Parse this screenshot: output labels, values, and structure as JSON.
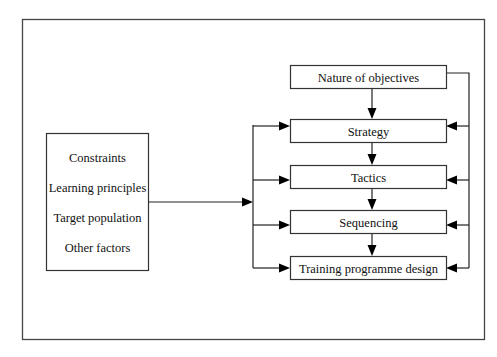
{
  "diagram": {
    "input_box": {
      "items": [
        "Constraints",
        "Learning principles",
        "Target population",
        "Other factors"
      ]
    },
    "nodes": [
      {
        "id": "objectives",
        "label": "Nature of objectives"
      },
      {
        "id": "strategy",
        "label": "Strategy"
      },
      {
        "id": "tactics",
        "label": "Tactics"
      },
      {
        "id": "sequencing",
        "label": "Sequencing"
      },
      {
        "id": "design",
        "label": "Training programme design"
      }
    ],
    "edges": [
      {
        "from": "objectives",
        "to": "strategy"
      },
      {
        "from": "strategy",
        "to": "tactics"
      },
      {
        "from": "tactics",
        "to": "sequencing"
      },
      {
        "from": "sequencing",
        "to": "design"
      },
      {
        "from": "input_box",
        "to": "strategy"
      },
      {
        "from": "input_box",
        "to": "tactics"
      },
      {
        "from": "input_box",
        "to": "sequencing"
      },
      {
        "from": "input_box",
        "to": "design"
      },
      {
        "from": "objectives",
        "to": "strategy"
      },
      {
        "from": "objectives",
        "to": "tactics"
      },
      {
        "from": "objectives",
        "to": "sequencing"
      },
      {
        "from": "objectives",
        "to": "design"
      }
    ]
  }
}
